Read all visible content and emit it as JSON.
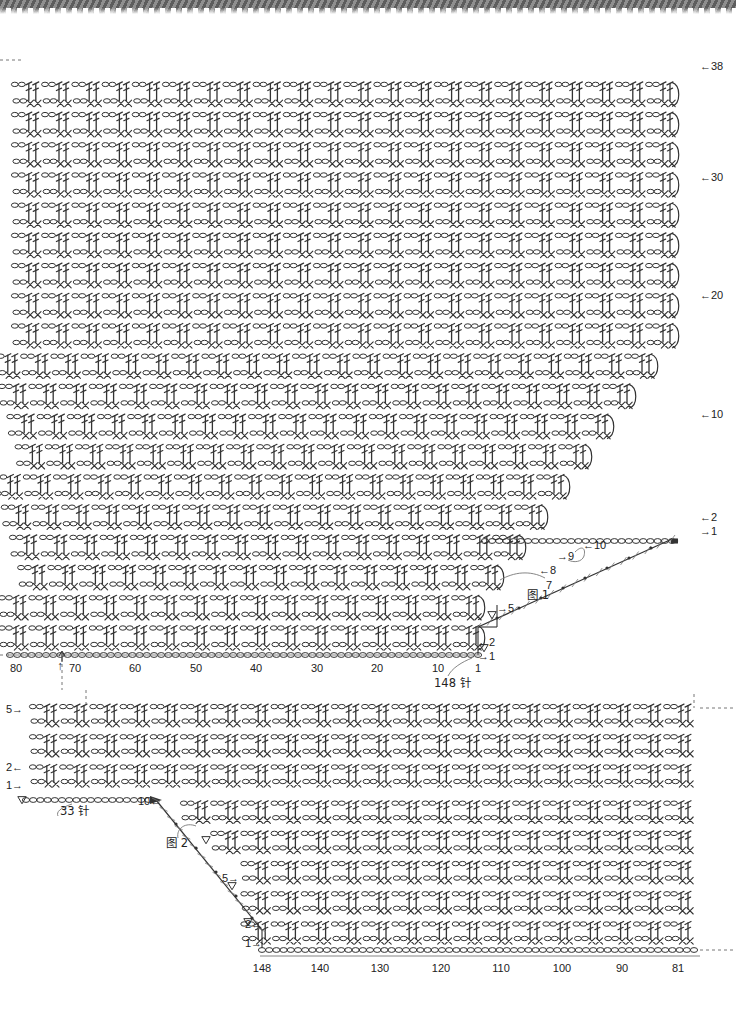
{
  "document": {
    "kind": "crochet-stitch-chart",
    "scan_artifact": "serrated-dark-edge-top"
  },
  "chart1": {
    "name": "Figure 1 chart",
    "figure_label": "图 1",
    "total_rows": 38,
    "row_labels_right": [
      {
        "text": "←38",
        "row": 38
      },
      {
        "text": "←30",
        "row": 30
      },
      {
        "text": "←20",
        "row": 20
      },
      {
        "text": "←10",
        "row": 10
      },
      {
        "text": "←2",
        "row": 2
      },
      {
        "text": "→1",
        "row": 1
      }
    ],
    "stair_labels": [
      {
        "text": "←10"
      },
      {
        "text": "→9"
      },
      {
        "text": "←8"
      },
      {
        "text": "7"
      },
      {
        "text": "→5"
      },
      {
        "text": "←2"
      },
      {
        "text": "→1"
      }
    ],
    "bottom_axis": {
      "ticks": [
        "80",
        "70",
        "60",
        "50",
        "40",
        "30",
        "20",
        "10",
        "1"
      ],
      "marker": "↑",
      "stitch_count": "148 针"
    }
  },
  "chart2": {
    "name": "Figure 2 chart",
    "figure_label": "图 2",
    "row_labels_left": [
      {
        "text": "5→"
      },
      {
        "text": "2←"
      },
      {
        "text": "1→"
      }
    ],
    "stair_labels": [
      {
        "text": "10←"
      },
      {
        "text": "5→"
      },
      {
        "text": "2←"
      },
      {
        "text": "1→"
      }
    ],
    "start_chain_count": "33 针",
    "bottom_axis": {
      "ticks": [
        "148",
        "140",
        "130",
        "120",
        "110",
        "100",
        "90",
        "81"
      ]
    }
  },
  "legend": {
    "stitches": {
      "chain": "ch / chain-stitch-oval",
      "single_crochet": "sc / x-stitch",
      "double_crochet": "dc / t-bar-stitch",
      "slip_stitch": "sl-st / dot",
      "turning_triangle": "turning-chain-triangle"
    }
  },
  "colors": {
    "ink": "#333333",
    "ink_light": "#777777",
    "paper": "#ffffff",
    "scan_edge": "#5d5d5d"
  }
}
